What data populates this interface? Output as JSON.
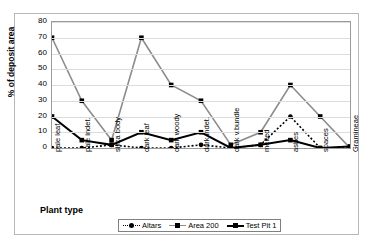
{
  "chart_data": {
    "type": "line",
    "title": "",
    "xlabel": "Plant type",
    "ylabel": "% of deposit area",
    "ylim": [
      0,
      80
    ],
    "yticks": [
      0,
      10,
      20,
      30,
      40,
      50,
      60,
      70,
      80
    ],
    "grid": true,
    "legend_position": "bottom",
    "categories": [
      "pale leaf",
      "pale indet.",
      "silica body",
      "dark leaf",
      "dark woody",
      "dark indet.",
      "dark v.bundle",
      "melted",
      "ashes",
      "spaces",
      "Gramineae"
    ],
    "series": [
      {
        "name": "Altars",
        "values": [
          0,
          0,
          2,
          0,
          0,
          2,
          0,
          2,
          20,
          0,
          0
        ],
        "color": "#000000",
        "line_style": "dotted",
        "marker": "circle"
      },
      {
        "name": "Area 200",
        "values": [
          70,
          30,
          5,
          70,
          40,
          30,
          2,
          10,
          40,
          20,
          0
        ],
        "color": "#8c8c8c",
        "line_style": "solid",
        "marker": "square"
      },
      {
        "name": "Test Pit 1",
        "values": [
          20,
          5,
          2,
          10,
          5,
          10,
          0,
          2,
          5,
          0,
          1
        ],
        "color": "#000000",
        "line_style": "solid",
        "marker": "square"
      }
    ]
  },
  "legend": {
    "items": [
      {
        "label": "Altars"
      },
      {
        "label": "Area 200"
      },
      {
        "label": "Test Pit 1"
      }
    ]
  }
}
